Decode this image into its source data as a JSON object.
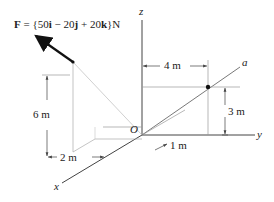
{
  "figure": {
    "force_label": {
      "prefix": "F",
      "eq": " = {50",
      "i": "i",
      "m1": " − 20",
      "j": "j",
      "m2": " + 20",
      "k": "k",
      "suffix": "}N"
    },
    "axes": {
      "x": "x",
      "y": "y",
      "z": "z",
      "a": "a",
      "origin": "O"
    },
    "dimensions": {
      "d4": "4 m",
      "d3": "3 m",
      "d6": "6 m",
      "d2": "2 m",
      "d1": "1 m"
    },
    "colors": {
      "line": "#333333",
      "thin": "#888888",
      "force": "#111111"
    }
  }
}
